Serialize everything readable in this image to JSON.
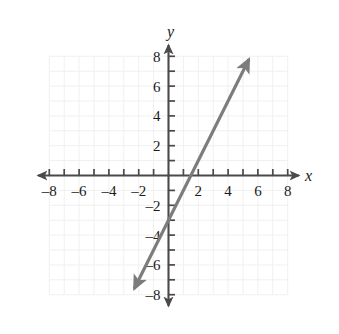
{
  "chart_data": {
    "type": "line",
    "title": "",
    "xlabel": "x",
    "ylabel": "y",
    "xlim": [
      -8.6,
      8.6
    ],
    "ylim": [
      -8.6,
      8.6
    ],
    "grid": true,
    "grid_step": 1,
    "grid_extent": [
      -8,
      8,
      -8,
      8
    ],
    "legend": "none",
    "x_tick_values": [
      -8,
      -7,
      -6,
      -5,
      -4,
      -3,
      -2,
      -1,
      1,
      2,
      3,
      4,
      5,
      6,
      7,
      8
    ],
    "y_tick_values": [
      -8,
      -7,
      -6,
      -5,
      -4,
      -3,
      -2,
      -1,
      1,
      2,
      3,
      4,
      5,
      6,
      7,
      8
    ],
    "x_tick_labels": [
      {
        "value": -8,
        "text": "–8"
      },
      {
        "value": -6,
        "text": "–6"
      },
      {
        "value": -4,
        "text": "–4"
      },
      {
        "value": -2,
        "text": "–2"
      },
      {
        "value": 2,
        "text": "2"
      },
      {
        "value": 4,
        "text": "4"
      },
      {
        "value": 6,
        "text": "6"
      },
      {
        "value": 8,
        "text": "8"
      }
    ],
    "y_tick_labels": [
      {
        "value": 8,
        "text": "8"
      },
      {
        "value": 6,
        "text": "6"
      },
      {
        "value": 4,
        "text": "4"
      },
      {
        "value": 2,
        "text": "2"
      },
      {
        "value": -2,
        "text": "–2"
      },
      {
        "value": -4,
        "text": "–4"
      },
      {
        "value": -6,
        "text": "–6"
      },
      {
        "value": -8,
        "text": "–8"
      }
    ],
    "series": [
      {
        "name": "line",
        "equation": "y = 2x - 3",
        "slope": 2,
        "y_intercept": -3,
        "x_intercept": 2,
        "arrows": "both",
        "color": "#7c7c7c",
        "points": [
          {
            "x": -2.3,
            "y": -7.6
          },
          {
            "x": 0,
            "y": -3
          },
          {
            "x": 2,
            "y": 0
          },
          {
            "x": 5.4,
            "y": 7.8
          }
        ]
      }
    ]
  },
  "style": {
    "axis_color": "#4a4a4a",
    "grid_color": "#f0f0f0",
    "line_color": "#7c7c7c",
    "text_color": "#1a1a1a",
    "background": "#ffffff"
  },
  "labels": {
    "x_axis_name": "x",
    "y_axis_name": "y"
  }
}
